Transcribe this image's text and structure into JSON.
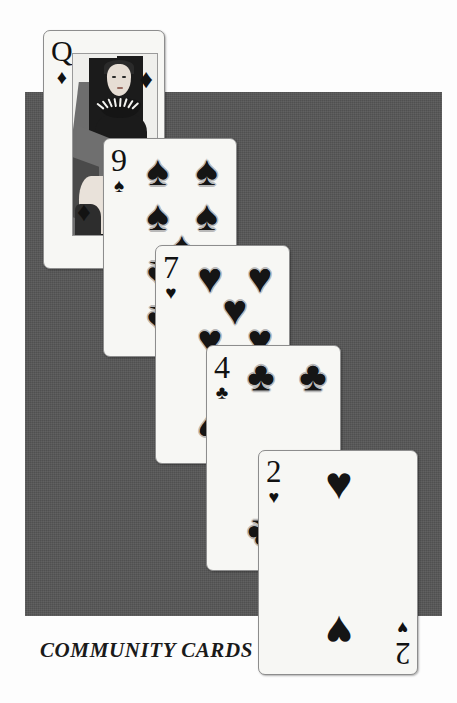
{
  "scene": {
    "title": "Community Cards",
    "background_color": "#fdfdfd",
    "backdrop_color": "#565656",
    "card_face_color": "#f7f7f4",
    "ink_color": "#151515"
  },
  "caption": {
    "text": "COMMUNITY CARDS"
  },
  "cards": [
    {
      "id": "queen-of-diamonds",
      "rank": "Q",
      "suit_name": "diamonds",
      "suit_glyph": "♦",
      "label": "Queen of Diamonds",
      "type": "court",
      "order": 1
    },
    {
      "id": "nine-of-spades",
      "rank": "9",
      "suit_name": "spades",
      "suit_glyph": "♠",
      "label": "Nine of Spades",
      "type": "pip",
      "pip_count": 9,
      "order": 2
    },
    {
      "id": "seven-of-hearts",
      "rank": "7",
      "suit_name": "hearts",
      "suit_glyph": "♥",
      "label": "Seven of Hearts",
      "type": "pip",
      "pip_count": 7,
      "order": 3
    },
    {
      "id": "four-of-clubs",
      "rank": "4",
      "suit_name": "clubs",
      "suit_glyph": "♣",
      "label": "Four of Clubs",
      "type": "pip",
      "pip_count": 4,
      "order": 4
    },
    {
      "id": "two-of-hearts",
      "rank": "2",
      "suit_name": "hearts",
      "suit_glyph": "♥",
      "label": "Two of Hearts",
      "type": "pip",
      "pip_count": 2,
      "order": 5
    }
  ]
}
